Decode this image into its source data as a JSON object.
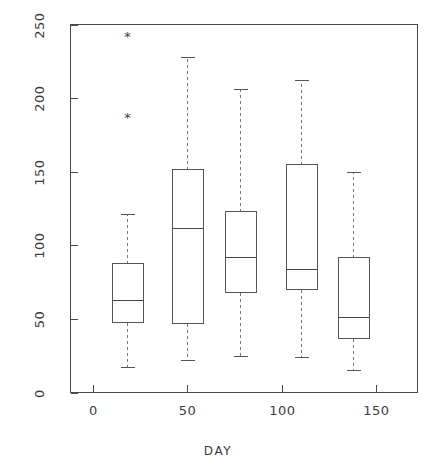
{
  "chart_data": {
    "type": "box",
    "title": "",
    "xlabel": "DAY",
    "ylabel": "",
    "xlim": [
      -12,
      172
    ],
    "ylim": [
      0,
      250
    ],
    "grid": false,
    "legend": null,
    "x_ticks": [
      0,
      50,
      100,
      150
    ],
    "x_tick_labels": [
      "0",
      "50",
      "100",
      "150"
    ],
    "y_ticks": [
      0,
      50,
      100,
      150,
      200,
      250
    ],
    "y_tick_labels": [
      "0",
      "50",
      "100",
      "150",
      "200",
      "250"
    ],
    "x_tick_label_0": "0",
    "x_tick_label_1": "50",
    "x_tick_label_2": "100",
    "x_tick_label_3": "150",
    "y_tick_label_0": "0",
    "y_tick_label_1": "50",
    "y_tick_label_2": "100",
    "y_tick_label_3": "150",
    "y_tick_label_4": "200",
    "y_tick_label_5": "250",
    "outlier_symbol": "*",
    "boxes": [
      {
        "name": "box-day-18",
        "x": 18,
        "whisker_low": 17,
        "q1": 48,
        "median": 63,
        "q3": 88,
        "whisker_high": 121,
        "outliers": [
          187,
          242
        ]
      },
      {
        "name": "box-day-50",
        "x": 50,
        "whisker_low": 22,
        "q1": 47,
        "median": 112,
        "q3": 152,
        "whisker_high": 228,
        "outliers": []
      },
      {
        "name": "box-day-78",
        "x": 78,
        "whisker_low": 25,
        "q1": 68,
        "median": 92,
        "q3": 123,
        "whisker_high": 206,
        "outliers": []
      },
      {
        "name": "box-day-110",
        "x": 110,
        "whisker_low": 24,
        "q1": 70,
        "median": 84,
        "q3": 155,
        "whisker_high": 212,
        "outliers": []
      },
      {
        "name": "box-day-138",
        "x": 138,
        "whisker_low": 15,
        "q1": 37,
        "median": 51,
        "q3": 92,
        "whisker_high": 150,
        "outliers": []
      }
    ],
    "colors": {
      "background": "#ffffff",
      "frame": "#4a4a4a",
      "box_stroke": "#555555",
      "median": "#444444",
      "whisker": "#777777",
      "text": "#3c3c3c"
    }
  }
}
